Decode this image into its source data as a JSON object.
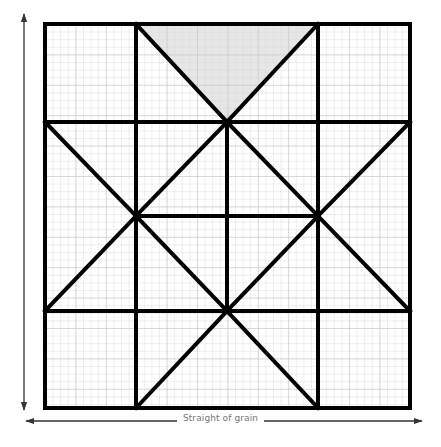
{
  "diagram": {
    "grain_label": "Straight of grain",
    "colors": {
      "outline": "#000000",
      "grid_fine": "#d9d9d9",
      "grid_major": "#c4c4c4",
      "shaded_patch": "#e6e6e6",
      "arrow": "#333333",
      "label": "#777777"
    },
    "outer_square": {
      "x": 45,
      "y": 24,
      "size": 365
    },
    "block_grid": {
      "rows": 4,
      "cols": 4,
      "subdivisions_per_block": 12
    },
    "shaded_patch": {
      "shape": "triangle",
      "points": [
        [
          136,
          24
        ],
        [
          318,
          24
        ],
        [
          227,
          122
        ]
      ]
    },
    "arrows": {
      "vertical": {
        "x": 24,
        "y1": 12,
        "y2": 412,
        "direction": "both"
      },
      "horizontal": {
        "y": 421,
        "x1": 24,
        "x2": 424,
        "direction": "both"
      }
    }
  }
}
